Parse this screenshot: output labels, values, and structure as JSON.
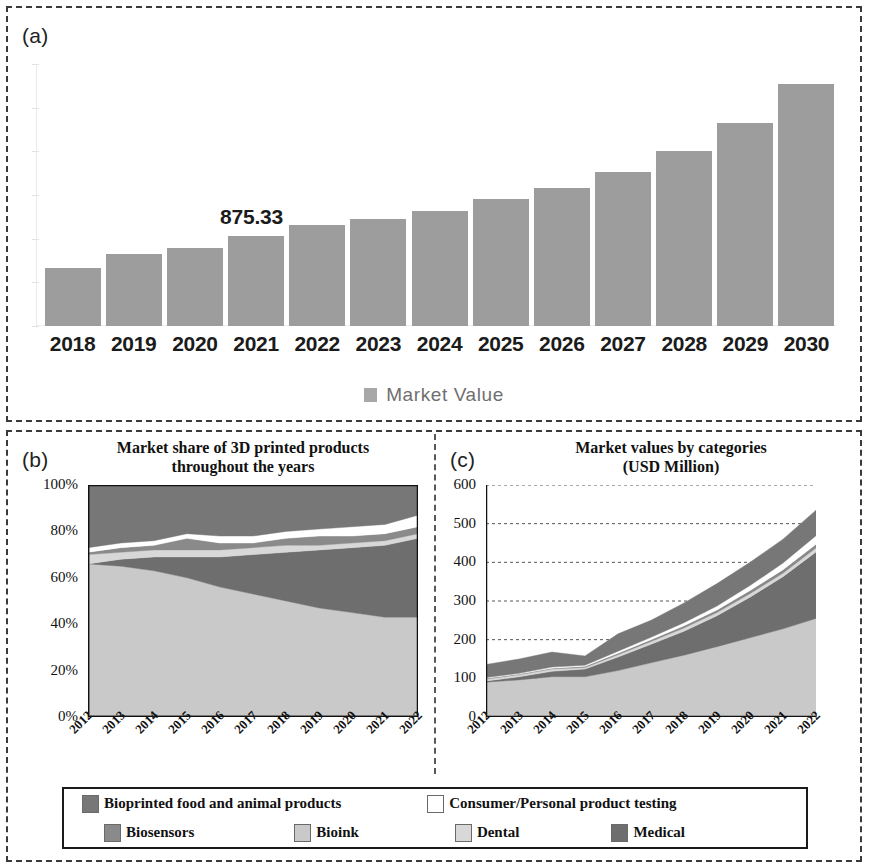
{
  "figure": {
    "panel_a_tag": "(a)",
    "panel_b_tag": "(b)",
    "panel_c_tag": "(c)"
  },
  "colors": {
    "bioprinted_food": "#777777",
    "consumer_testing": "#ffffff",
    "biosensors": "#8a8a8a",
    "bioink": "#c9c9c9",
    "dental": "#d8d8d8",
    "medical": "#6e6e6e",
    "bar_gray": "#9d9d9d",
    "frame": "#3a3a3a"
  },
  "legend": {
    "row1": [
      {
        "label": "Bioprinted food and animal products",
        "color": "#777777"
      },
      {
        "label": "Consumer/Personal product testing",
        "color": "#ffffff"
      }
    ],
    "row2": [
      {
        "label": "Biosensors",
        "color": "#8a8a8a"
      },
      {
        "label": "Bioink",
        "color": "#c9c9c9"
      },
      {
        "label": "Dental",
        "color": "#d8d8d8"
      },
      {
        "label": "Medical",
        "color": "#6e6e6e"
      }
    ]
  },
  "chart_data": [
    {
      "panel": "a",
      "type": "bar",
      "title": "",
      "xlabel": "",
      "ylabel": "",
      "grid": false,
      "legend_position": "bottom",
      "legend": [
        "Market Value"
      ],
      "categories": [
        "2018",
        "2019",
        "2020",
        "2021",
        "2022",
        "2023",
        "2024",
        "2025",
        "2026",
        "2027",
        "2028",
        "2029",
        "2030"
      ],
      "values": [
        560,
        700,
        760,
        875.33,
        980,
        1040,
        1120,
        1240,
        1340,
        1500,
        1700,
        1980,
        2360
      ],
      "annotations": [
        {
          "category": "2021",
          "text": "875.33",
          "value": 875.33
        }
      ],
      "ylim": [
        0,
        2550
      ],
      "tick_labels_visible": false
    },
    {
      "panel": "b",
      "type": "area",
      "title": "Market share of 3D printed products throughout the years",
      "xlabel": "",
      "ylabel": "",
      "grid": false,
      "stacked": true,
      "normalized": true,
      "legend_position": "shared-bottom",
      "x": [
        "2012",
        "2013",
        "2014",
        "2015",
        "2016",
        "2017",
        "2018",
        "2019",
        "2020",
        "2021",
        "2022"
      ],
      "ylim": [
        0,
        100
      ],
      "ytick_labels": [
        "0%",
        "20%",
        "40%",
        "60%",
        "80%",
        "100%"
      ],
      "yticks": [
        0,
        20,
        40,
        60,
        80,
        100
      ],
      "series": [
        {
          "name": "Bioink",
          "color": "#c9c9c9",
          "values": [
            66,
            65,
            63,
            60,
            56,
            53,
            50,
            47,
            45,
            43,
            43
          ]
        },
        {
          "name": "Medical",
          "color": "#6e6e6e",
          "values": [
            0,
            3,
            6,
            9,
            13,
            17,
            21,
            25,
            28,
            31,
            34
          ]
        },
        {
          "name": "Dental",
          "color": "#d8d8d8",
          "values": [
            4,
            3,
            3,
            3,
            3,
            3,
            3,
            2,
            2,
            2,
            2
          ]
        },
        {
          "name": "Biosensors",
          "color": "#8a8a8a",
          "values": [
            1,
            2,
            2,
            5,
            3,
            2,
            3,
            4,
            3,
            3,
            3
          ]
        },
        {
          "name": "Consumer/Personal product testing",
          "color": "#ffffff",
          "values": [
            2,
            2,
            2,
            2,
            3,
            3,
            3,
            3,
            4,
            4,
            5
          ]
        },
        {
          "name": "Bioprinted food and animal products",
          "color": "#777777",
          "values": [
            27,
            25,
            24,
            21,
            22,
            22,
            20,
            19,
            18,
            17,
            13
          ]
        }
      ]
    },
    {
      "panel": "c",
      "type": "area",
      "title": "Market values by categories (USD Million)",
      "xlabel": "",
      "ylabel": "USD Million",
      "grid": true,
      "stacked": true,
      "legend_position": "shared-bottom",
      "x": [
        "2012",
        "2013",
        "2014",
        "2015",
        "2016",
        "2017",
        "2018",
        "2019",
        "2020",
        "2021",
        "2022"
      ],
      "ylim": [
        0,
        600
      ],
      "yticks": [
        0,
        100,
        200,
        300,
        400,
        500,
        600
      ],
      "ytick_labels": [
        "0",
        "100",
        "200",
        "300",
        "400",
        "500",
        "600"
      ],
      "totals": [
        136,
        150,
        168,
        158,
        215,
        250,
        295,
        345,
        400,
        460,
        535
      ],
      "series": [
        {
          "name": "Bioink",
          "color": "#c9c9c9",
          "values": [
            90,
            96,
            104,
            104,
            120,
            140,
            160,
            182,
            205,
            228,
            255
          ]
        },
        {
          "name": "Medical",
          "color": "#6e6e6e",
          "values": [
            3,
            8,
            14,
            20,
            35,
            48,
            62,
            80,
            105,
            135,
            172
          ]
        },
        {
          "name": "Dental",
          "color": "#d8d8d8",
          "values": [
            5,
            5,
            6,
            4,
            6,
            7,
            8,
            8,
            9,
            9,
            10
          ]
        },
        {
          "name": "Biosensors",
          "color": "#8a8a8a",
          "values": [
            2,
            2,
            2,
            3,
            4,
            5,
            6,
            7,
            8,
            9,
            10
          ]
        },
        {
          "name": "Consumer/Personal product testing",
          "color": "#ffffff",
          "values": [
            2,
            2,
            3,
            3,
            5,
            6,
            8,
            10,
            13,
            17,
            22
          ]
        },
        {
          "name": "Bioprinted food and animal products",
          "color": "#777777",
          "values": [
            34,
            37,
            39,
            24,
            45,
            44,
            51,
            58,
            60,
            62,
            66
          ]
        }
      ]
    }
  ]
}
